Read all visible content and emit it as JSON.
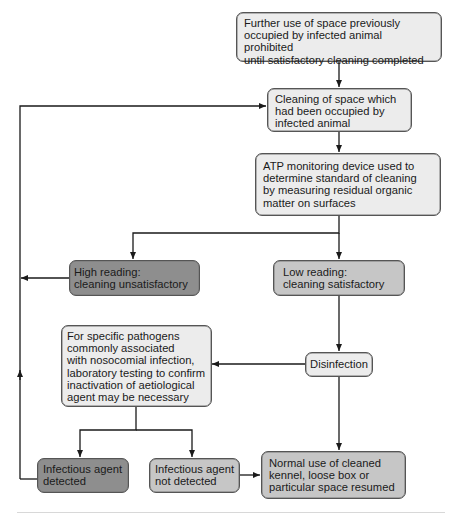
{
  "diagram": {
    "type": "flowchart",
    "colors": {
      "light_box": "#ececec",
      "mid_box": "#c6c6c6",
      "dark_box": "#8e8e8e",
      "line": "#1a1a1a",
      "border": "#555555"
    },
    "nodes": {
      "prohibited": {
        "text": "Further use of space previously\noccupied by infected animal prohibited\nuntil satisfactory cleaning completed",
        "shade": "light"
      },
      "cleaning": {
        "text": "Cleaning of space which\nhad been occupied by\ninfected animal",
        "shade": "light"
      },
      "atp": {
        "text": "ATP monitoring device used to\ndetermine standard of cleaning\nby measuring residual organic\nmatter on surfaces",
        "shade": "light"
      },
      "high_reading": {
        "text": "High reading:\n   cleaning unsatisfactory",
        "shade": "dark"
      },
      "low_reading": {
        "text": "Low reading:\n   cleaning satisfactory",
        "shade": "mid"
      },
      "disinfection": {
        "text": "Disinfection",
        "shade": "light"
      },
      "lab_testing": {
        "text": "For specific pathogens\ncommonly associated\nwith nosocomial infection,\nlaboratory testing to confirm\ninactivation of aetiological\nagent may be necessary",
        "shade": "light"
      },
      "agent_detected": {
        "text": "Infectious agent\ndetected",
        "shade": "dark"
      },
      "agent_not_detected": {
        "text": "Infectious agent\n not detected",
        "shade": "mid"
      },
      "normal_use": {
        "text": "Normal use of cleaned\nkennel, loose box or\nparticular space resumed",
        "shade": "mid"
      }
    },
    "edges": [
      {
        "from": "prohibited",
        "to": "cleaning"
      },
      {
        "from": "cleaning",
        "to": "atp"
      },
      {
        "from": "atp",
        "to": "high_reading"
      },
      {
        "from": "atp",
        "to": "low_reading"
      },
      {
        "from": "high_reading",
        "to": "cleaning"
      },
      {
        "from": "low_reading",
        "to": "disinfection"
      },
      {
        "from": "disinfection",
        "to": "lab_testing"
      },
      {
        "from": "disinfection",
        "to": "normal_use"
      },
      {
        "from": "lab_testing",
        "to": "agent_detected"
      },
      {
        "from": "lab_testing",
        "to": "agent_not_detected"
      },
      {
        "from": "agent_detected",
        "to": "cleaning"
      },
      {
        "from": "agent_not_detected",
        "to": "normal_use"
      }
    ]
  }
}
